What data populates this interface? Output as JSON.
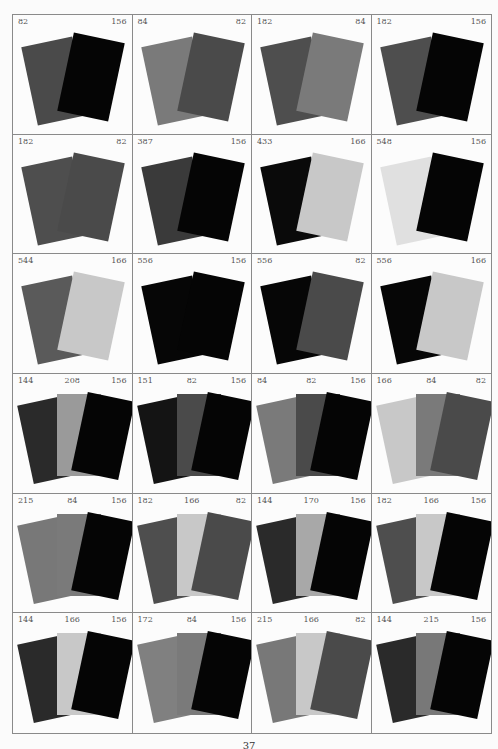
{
  "colors": {
    "82": "#4a4a4a",
    "84": "#7a7a7a",
    "144": "#2a2a2a",
    "151": "#141414",
    "156": "#050505",
    "166": "#c8c8c8",
    "170": "#a8a8a8",
    "172": "#808080",
    "182": "#4e4e4e",
    "208": "#9a9a9a",
    "215": "#787878",
    "387": "#3a3a3a",
    "433": "#0a0a0a",
    "544": "#5a5a5a",
    "548": "#e0e0e0",
    "556": "#060606"
  },
  "cells": [
    {
      "labels": [
        "82",
        "156"
      ]
    },
    {
      "labels": [
        "84",
        "82"
      ]
    },
    {
      "labels": [
        "182",
        "84"
      ]
    },
    {
      "labels": [
        "182",
        "156"
      ]
    },
    {
      "labels": [
        "182",
        "82"
      ]
    },
    {
      "labels": [
        "387",
        "156"
      ]
    },
    {
      "labels": [
        "433",
        "166"
      ]
    },
    {
      "labels": [
        "548",
        "156"
      ]
    },
    {
      "labels": [
        "544",
        "166"
      ]
    },
    {
      "labels": [
        "556",
        "156"
      ]
    },
    {
      "labels": [
        "556",
        "82"
      ]
    },
    {
      "labels": [
        "556",
        "166"
      ]
    },
    {
      "labels": [
        "144",
        "208",
        "156"
      ]
    },
    {
      "labels": [
        "151",
        "82",
        "156"
      ]
    },
    {
      "labels": [
        "84",
        "82",
        "156"
      ]
    },
    {
      "labels": [
        "166",
        "84",
        "82"
      ]
    },
    {
      "labels": [
        "215",
        "84",
        "156"
      ]
    },
    {
      "labels": [
        "182",
        "166",
        "82"
      ]
    },
    {
      "labels": [
        "144",
        "170",
        "156"
      ]
    },
    {
      "labels": [
        "182",
        "166",
        "156"
      ]
    },
    {
      "labels": [
        "144",
        "166",
        "156"
      ]
    },
    {
      "labels": [
        "172",
        "84",
        "156"
      ]
    },
    {
      "labels": [
        "215",
        "166",
        "82"
      ]
    },
    {
      "labels": [
        "144",
        "215",
        "156"
      ]
    }
  ],
  "footer": {
    "page_number": "37"
  }
}
